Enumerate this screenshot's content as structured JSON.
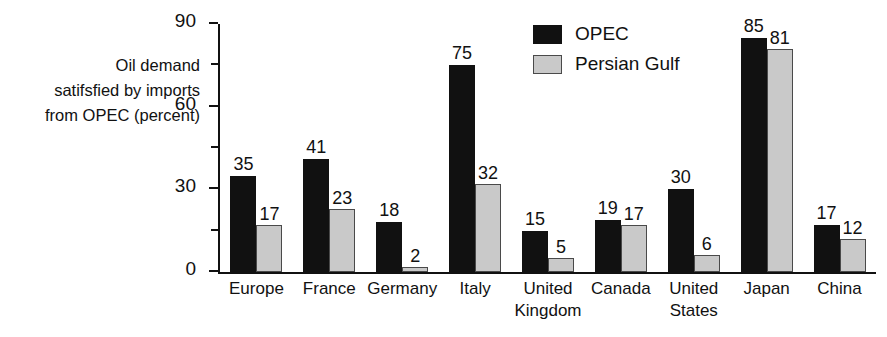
{
  "chart_data": {
    "type": "bar",
    "title": "",
    "xlabel": "",
    "ylabel": "Oil demand\nsatifsfied by imports\nfrom OPEC (percent)",
    "ylim": [
      0,
      90
    ],
    "yticks": [
      0,
      30,
      60,
      90
    ],
    "yticks_minor": [
      15,
      45,
      75
    ],
    "grid": false,
    "legend_position": "top-right",
    "categories": [
      "Europe",
      "France",
      "Germany",
      "Italy",
      "United\nKingdom",
      "Canada",
      "United\nStates",
      "Japan",
      "China"
    ],
    "series": [
      {
        "name": "OPEC",
        "color": "#111111",
        "values": [
          35,
          41,
          18,
          75,
          15,
          19,
          30,
          85,
          17
        ]
      },
      {
        "name": "Persian Gulf",
        "color": "#c9c9c9",
        "values": [
          17,
          23,
          2,
          32,
          5,
          17,
          6,
          81,
          12
        ]
      }
    ]
  },
  "axis": {
    "caption": "Oil demand\nsatifsfied by imports\nfrom OPEC (percent)",
    "tick_labels": [
      "90",
      "60",
      "30",
      "0"
    ]
  },
  "legend": {
    "items": [
      {
        "label": "OPEC",
        "swatch": "black"
      },
      {
        "label": "Persian Gulf",
        "swatch": "gray"
      }
    ]
  }
}
